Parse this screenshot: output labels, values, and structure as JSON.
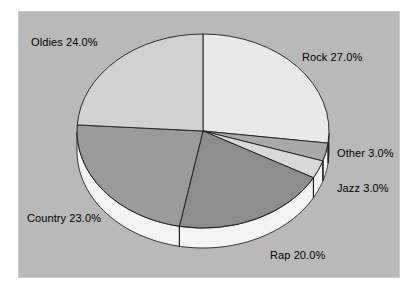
{
  "figure": {
    "panel_background": "#b9b9b9",
    "page_background": "#ffffff",
    "panel_border": "#cccccc"
  },
  "chart_data": {
    "type": "pie",
    "title": "",
    "subtitle": "",
    "xlabel": "",
    "ylabel": "",
    "legend_position": "none",
    "grid": false,
    "three_d": true,
    "start_angle_deg": 90,
    "direction": "clockwise",
    "categories": [
      "Rock",
      "Other",
      "Jazz",
      "Rap",
      "Country",
      "Oldies"
    ],
    "values": [
      27.0,
      3.0,
      3.0,
      20.0,
      23.0,
      24.0
    ],
    "value_unit": "%",
    "labels": [
      "Rock  27.0%",
      "Other  3.0%",
      "Jazz  3.0%",
      "Rap  20.0%",
      "Country  23.0%",
      "Oldies 24.0%"
    ],
    "slice_colors": [
      "#e9e9e9",
      "#a9a9a9",
      "#d9d9d9",
      "#8d8d8d",
      "#9b9b9b",
      "#d1d1d1"
    ],
    "side_wall_color": "#f4f4f4",
    "outline_color": "#1c1c1c"
  },
  "labels": {
    "oldies": "Oldies 24.0%",
    "rock": "Rock  27.0%",
    "other": "Other  3.0%",
    "jazz": "Jazz  3.0%",
    "country": "Country  23.0%",
    "rap": "Rap  20.0%"
  }
}
